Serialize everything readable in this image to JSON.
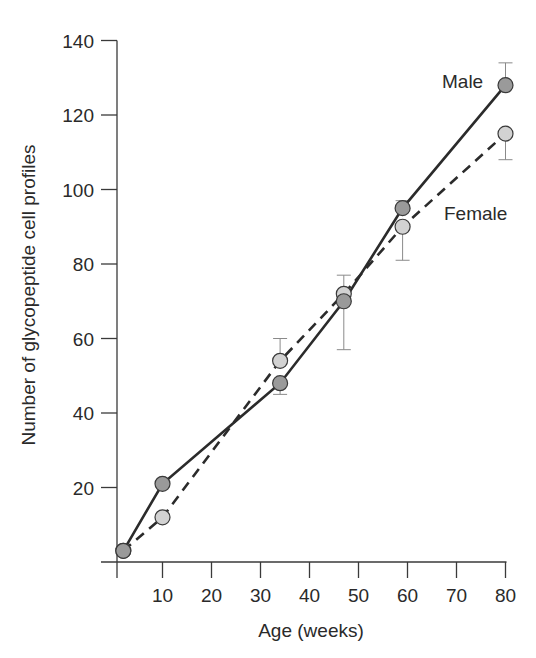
{
  "chart_data": {
    "type": "line",
    "title": "",
    "xlabel": "Age (weeks)",
    "ylabel": "Number of glycopeptide cell profiles",
    "xlim": [
      0,
      80
    ],
    "ylim": [
      0,
      140
    ],
    "xticks": [
      10,
      20,
      30,
      40,
      50,
      60,
      70,
      80
    ],
    "yticks": [
      20,
      40,
      60,
      80,
      100,
      120,
      140
    ],
    "grid": false,
    "legend": "inline labels near series ends",
    "series": [
      {
        "name": "Male",
        "line_style": "solid",
        "marker_fill": "#9a9a9a",
        "x": [
          2,
          10,
          34,
          47,
          59,
          80
        ],
        "values": [
          3,
          21,
          48,
          70,
          95,
          128
        ],
        "error_low": [
          null,
          null,
          45,
          null,
          95,
          null
        ],
        "error_high": [
          null,
          null,
          null,
          null,
          97,
          134
        ]
      },
      {
        "name": "Female",
        "line_style": "dashed",
        "marker_fill": "#d2d2d2",
        "x": [
          2,
          10,
          34,
          47,
          59,
          80
        ],
        "values": [
          3,
          12,
          54,
          72,
          90,
          115
        ],
        "error_low": [
          null,
          null,
          null,
          57,
          81,
          108
        ],
        "error_high": [
          null,
          null,
          60,
          77,
          null,
          null
        ]
      }
    ],
    "annotations": [
      {
        "text": "Male",
        "x": 80,
        "y": 128,
        "position": "left"
      },
      {
        "text": "Female",
        "x": 68,
        "y": 94,
        "position": "right"
      }
    ]
  },
  "labels": {
    "male": "Male",
    "female": "Female",
    "xlabel": "Age (weeks)",
    "ylabel": "Number of glycopeptide cell profiles"
  }
}
